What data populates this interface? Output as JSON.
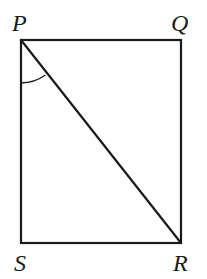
{
  "diagram": {
    "type": "rectangle-with-diagonal",
    "vertices": {
      "P": {
        "label": "P",
        "x": 21,
        "y": 40
      },
      "Q": {
        "label": "Q",
        "x": 181,
        "y": 40
      },
      "R": {
        "label": "R",
        "x": 181,
        "y": 243
      },
      "S": {
        "label": "S",
        "x": 21,
        "y": 243
      }
    },
    "segments": [
      "PQ",
      "QR",
      "RS",
      "SP",
      "PR"
    ],
    "marked_angle": {
      "vertex": "P",
      "between": [
        "PS",
        "PR"
      ]
    },
    "stroke_color": "#1a1a1a",
    "background": "#ffffff"
  }
}
